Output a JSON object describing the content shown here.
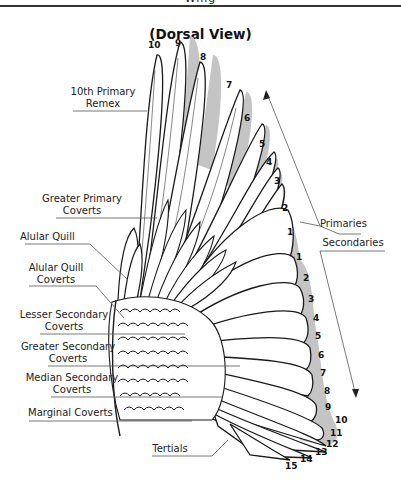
{
  "header": {
    "title_partial": "Wing"
  },
  "diagram": {
    "title": "(Dorsal View)",
    "labels": {
      "tenth_primary_remex": [
        "10th Primary",
        "Remex"
      ],
      "greater_primary_coverts": [
        "Greater Primary",
        "Coverts"
      ],
      "alular_quill": "Alular Quill",
      "alular_quill_coverts": [
        "Alular Quill",
        "Coverts"
      ],
      "lesser_secondary_coverts": [
        "Lesser Secondary",
        "Coverts"
      ],
      "greater_secondary_coverts": [
        "Greater Secondary",
        "Coverts"
      ],
      "median_secondary_coverts": [
        "Median Secondary",
        "Coverts"
      ],
      "marginal_coverts": "Marginal Coverts",
      "tertials": "Tertials",
      "primaries": "Primaries",
      "secondaries": "Secondaries"
    },
    "primary_numbers": [
      "10",
      "9",
      "8",
      "7",
      "6",
      "5",
      "4",
      "3",
      "2",
      "1"
    ],
    "secondary_numbers": [
      "1",
      "2",
      "3",
      "4",
      "5",
      "6",
      "7",
      "8",
      "9",
      "10",
      "11",
      "12",
      "13",
      "14",
      "15"
    ],
    "colors": {
      "feather_shadow": "#c4c4c4",
      "outline": "#1a1a1a",
      "leader": "#555555"
    }
  }
}
